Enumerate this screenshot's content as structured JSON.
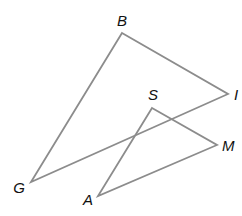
{
  "diagram": {
    "type": "geometry",
    "line_color": "#8c8c8c",
    "label_color": "#111111",
    "points": {
      "B": {
        "x": 122,
        "y": 33,
        "label": "B",
        "lx": 122,
        "ly": 26,
        "anchor": "middle"
      },
      "I": {
        "x": 228,
        "y": 94,
        "label": "I",
        "lx": 234,
        "ly": 100,
        "anchor": "start"
      },
      "G": {
        "x": 31,
        "y": 182,
        "label": "G",
        "lx": 19,
        "ly": 193,
        "anchor": "middle"
      },
      "S": {
        "x": 152,
        "y": 108,
        "label": "S",
        "lx": 153,
        "ly": 100,
        "anchor": "middle"
      },
      "M": {
        "x": 217,
        "y": 145,
        "label": "M",
        "lx": 222,
        "ly": 151,
        "anchor": "start"
      },
      "A": {
        "x": 98,
        "y": 196,
        "label": "A",
        "lx": 88,
        "ly": 205,
        "anchor": "middle"
      }
    },
    "triangles": [
      {
        "name": "triangle-BGI",
        "vertices": [
          "B",
          "I",
          "G"
        ]
      },
      {
        "name": "triangle-SAM",
        "vertices": [
          "S",
          "M",
          "A"
        ]
      }
    ]
  }
}
